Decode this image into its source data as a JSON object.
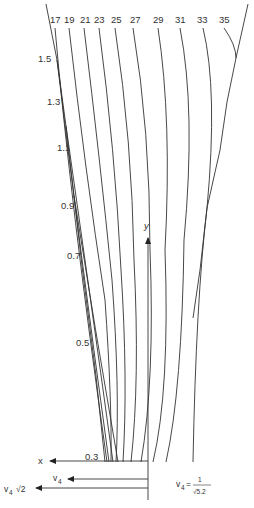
{
  "diagram": {
    "top_labels": [
      "17",
      "19",
      "21",
      "23",
      "25",
      "27",
      "29",
      "31",
      "33",
      "35"
    ],
    "left_labels": [
      "1.5",
      "1.3",
      "1.1",
      "0.9",
      "0.7",
      "0.5",
      "0.3"
    ],
    "axes": {
      "x_label": "x",
      "y_label": "y",
      "v4_label": "v",
      "v4_sub": "4",
      "v4sqrt2_label": "v",
      "v4sqrt2_sub": "4",
      "v4sqrt2_suffix": "√2"
    },
    "formula": {
      "lhs": "v",
      "lhs_sub": "4",
      "equals": "=",
      "numerator": "1",
      "denominator": "√5.2"
    }
  }
}
